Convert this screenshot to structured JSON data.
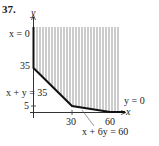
{
  "problem_number": "37.",
  "axes": {
    "x_label": "x",
    "y_label": "y",
    "x_ticks": [
      "30",
      "60"
    ],
    "y_ticks": [
      "35",
      "5"
    ]
  },
  "constraints": [
    {
      "label": "x = 0"
    },
    {
      "label": "x + y = 35"
    },
    {
      "label": "x + 6y = 60"
    },
    {
      "label": "y = 0"
    }
  ],
  "feasible_region": {
    "style": "vertical-hatch",
    "vertices": [
      [
        0,
        35
      ],
      [
        30,
        5
      ],
      [
        60,
        0
      ]
    ],
    "unbounded": true
  },
  "colors": {
    "boundary": "#111111",
    "hatch": "#9a9a9a",
    "axis": "#333333"
  }
}
